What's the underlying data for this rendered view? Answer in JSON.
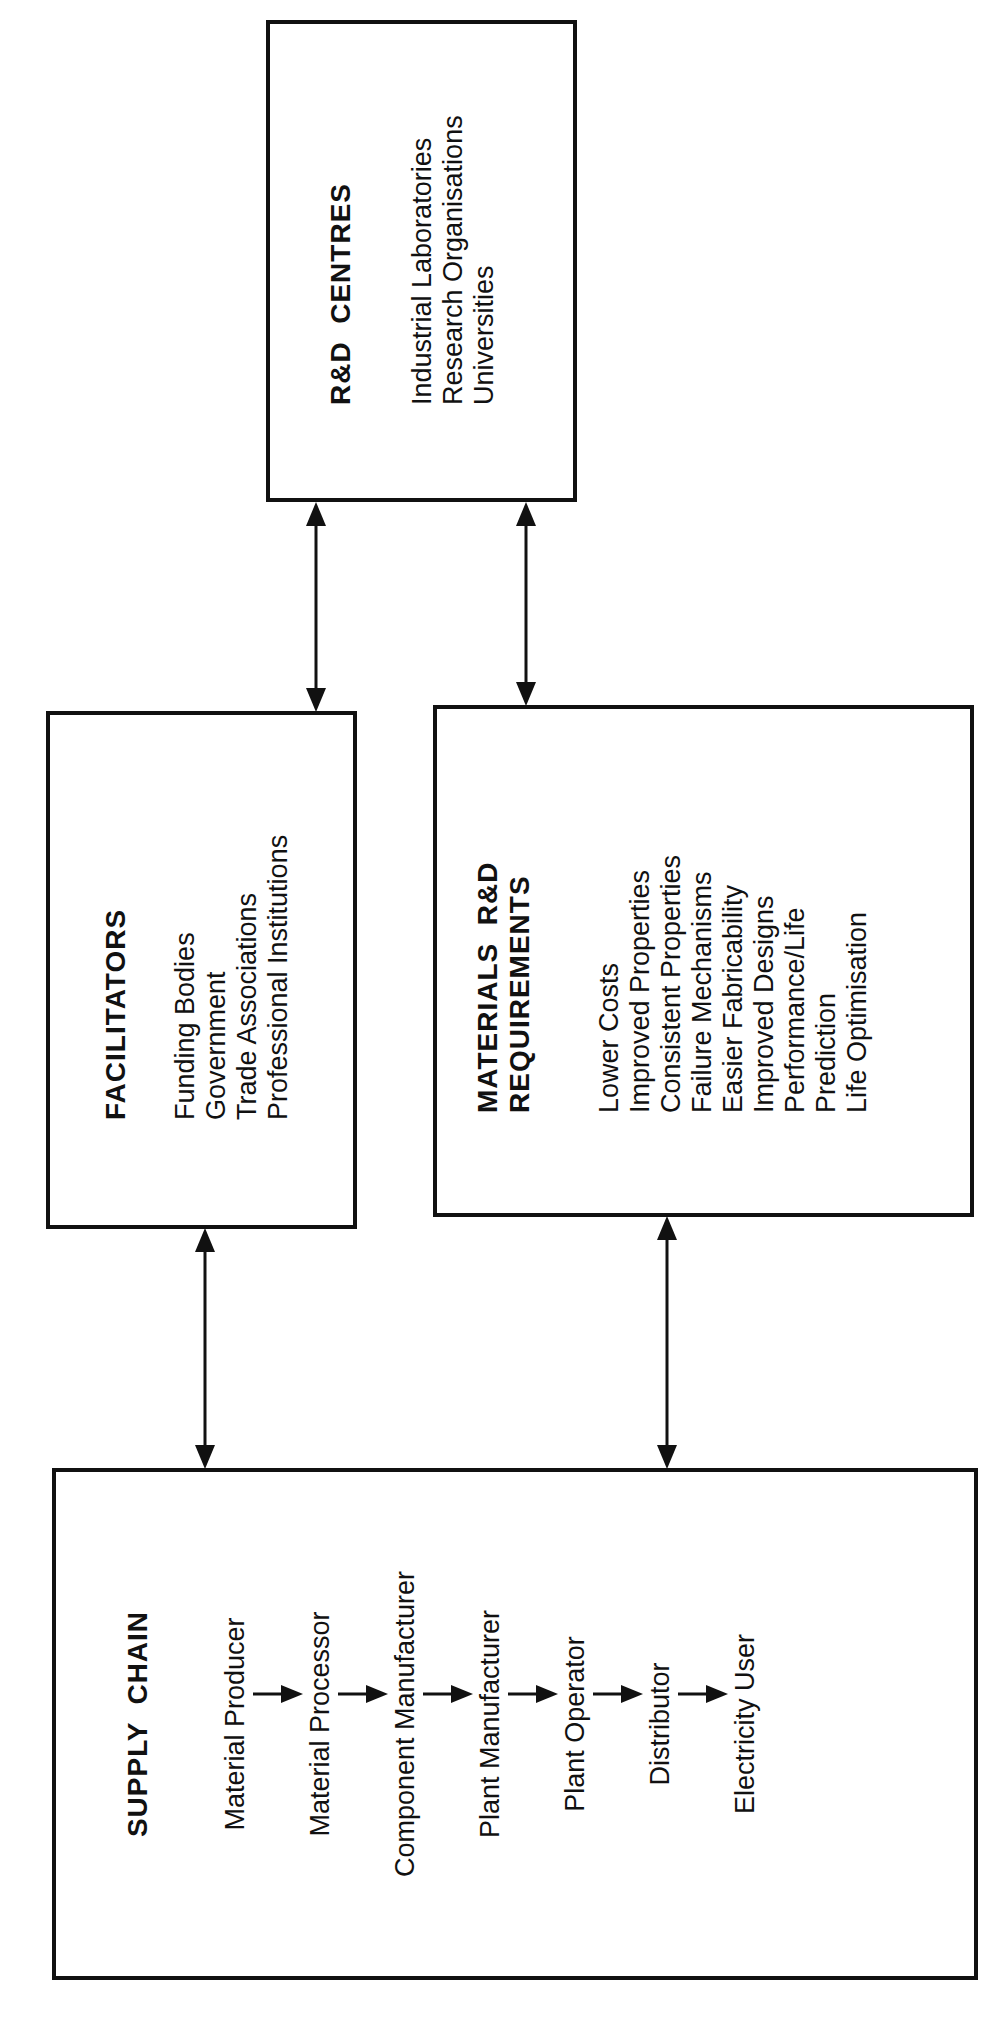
{
  "rd_centres": {
    "title": "R&D  CENTRES",
    "items": [
      "Industrial Laboratories",
      "Research Organisations",
      "Universities"
    ]
  },
  "facilitators": {
    "title": "FACILITATORS",
    "items": [
      "Funding Bodies",
      "Government",
      "Trade Associations",
      "Professional Institutions"
    ]
  },
  "materials": {
    "title_line1": "MATERIALS  R&D",
    "title_line2": "REQUIREMENTS",
    "items": [
      "Lower Costs",
      "Improved Properties",
      "Consistent Properties",
      "Failure Mechanisms",
      "Easier Fabricability",
      "Improved Designs",
      "Performance/Life",
      "Prediction",
      "Life Optimisation"
    ]
  },
  "supply_chain": {
    "title": "SUPPLY  CHAIN",
    "steps": [
      "Material Producer",
      "Material Processor",
      "Component Manufacturer",
      "Plant Manufacturer",
      "Plant Operator",
      "Distributor",
      "Electricity User"
    ]
  },
  "connections": [
    {
      "from": "facilitators",
      "to": "rd_centres",
      "type": "bidirectional"
    },
    {
      "from": "materials",
      "to": "rd_centres",
      "type": "bidirectional"
    },
    {
      "from": "supply_chain",
      "to": "facilitators",
      "type": "bidirectional"
    },
    {
      "from": "supply_chain",
      "to": "materials",
      "type": "bidirectional"
    }
  ]
}
